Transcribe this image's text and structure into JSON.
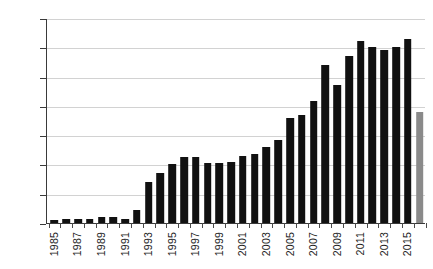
{
  "chart_data": {
    "type": "bar",
    "title": "",
    "subtitle": "",
    "xlabel": "",
    "ylabel": "",
    "ylim": [
      0,
      140
    ],
    "y_ticks": [
      0,
      20,
      40,
      60,
      80,
      100,
      120,
      140
    ],
    "grid": "horizontal",
    "legend": "none",
    "categories": [
      "1985",
      "1986",
      "1987",
      "1988",
      "1989",
      "1990",
      "1991",
      "1992",
      "1993",
      "1994",
      "1995",
      "1996",
      "1997",
      "1998",
      "1999",
      "2000",
      "2001",
      "2002",
      "2003",
      "2004",
      "2005",
      "2006",
      "2007",
      "2008",
      "2009",
      "2010",
      "2011",
      "2012",
      "2013",
      "2014",
      "2015",
      "2016"
    ],
    "x_tick_labels": [
      "1985",
      "1987",
      "1989",
      "1991",
      "1993",
      "1995",
      "1997",
      "1999",
      "2001",
      "2003",
      "2005",
      "2007",
      "2009",
      "2011",
      "2013",
      "2015"
    ],
    "values": [
      2,
      3,
      3,
      3,
      4,
      4,
      3,
      9,
      28,
      34,
      40,
      45,
      45,
      41,
      41,
      42,
      46,
      47,
      52,
      57,
      72,
      74,
      83,
      108,
      94,
      114,
      124,
      120,
      118,
      120,
      126,
      76
    ],
    "series": [
      {
        "name": "annual count",
        "values": [
          2,
          3,
          3,
          3,
          4,
          4,
          3,
          9,
          28,
          34,
          40,
          45,
          45,
          41,
          41,
          42,
          46,
          47,
          52,
          57,
          72,
          74,
          83,
          108,
          94,
          114,
          124,
          120,
          118,
          120,
          126,
          76
        ]
      }
    ],
    "bar_colors": [
      "#111111",
      "#111111",
      "#111111",
      "#111111",
      "#111111",
      "#111111",
      "#111111",
      "#111111",
      "#111111",
      "#111111",
      "#111111",
      "#111111",
      "#111111",
      "#111111",
      "#111111",
      "#111111",
      "#111111",
      "#111111",
      "#111111",
      "#111111",
      "#111111",
      "#111111",
      "#111111",
      "#111111",
      "#111111",
      "#111111",
      "#111111",
      "#111111",
      "#111111",
      "#111111",
      "#111111",
      "#8a8a8a"
    ],
    "colors": {
      "bar_primary": "#111111",
      "bar_highlight": "#8a8a8a",
      "axis": "#3a3a3a",
      "gridline": "#d2d2d2",
      "text": "#1c1c1c",
      "background": "#ffffff"
    }
  }
}
